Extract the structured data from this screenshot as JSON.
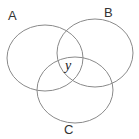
{
  "diagram": {
    "type": "venn",
    "sets": [
      {
        "label": "A",
        "cx": 45,
        "cy": 58,
        "rx": 38,
        "ry": 33
      },
      {
        "label": "C",
        "cx": 95,
        "cy": 53,
        "rx": 38,
        "ry": 34
      },
      {
        "label": "B",
        "cx": 75,
        "cy": 90,
        "rx": 38,
        "ry": 33
      }
    ],
    "center_label": "y",
    "stroke_color": "#8a8a8a"
  }
}
